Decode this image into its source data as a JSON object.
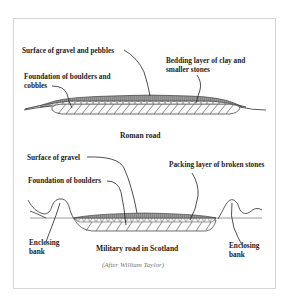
{
  "roman": {
    "labels": {
      "surface": "Surface of gravel and pebbles",
      "foundation_1": "Foundation of boulders and",
      "foundation_2": "cobbles",
      "bedding_1": "Bedding layer of clay and",
      "bedding_2": "smaller stones"
    },
    "caption": "Roman road"
  },
  "scotland": {
    "labels": {
      "surface": "Surface of gravel",
      "foundation": "Foundation of boulders",
      "packing": "Packing layer of broken stones",
      "bank_left_1": "Enclosing",
      "bank_left_2": "bank",
      "bank_right_1": "Enclosing",
      "bank_right_2": "bank"
    },
    "caption": "Military road in Scotland",
    "credit": "(After William Taylor)"
  },
  "colors": {
    "ink": "#222222",
    "surface_fill": "#8a8a8a",
    "frame": "#d6d6d6",
    "credit": "#777777"
  }
}
